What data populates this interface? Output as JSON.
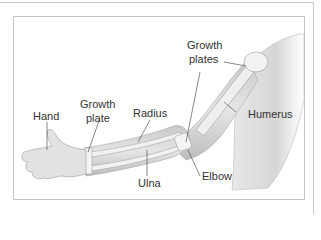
{
  "diagram": {
    "labels": {
      "growth_plates_top_1": "Growth",
      "growth_plates_top_2": "plates",
      "hand": "Hand",
      "growth_plate_1": "Growth",
      "growth_plate_2": "plate",
      "radius": "Radius",
      "humerus": "Humerus",
      "elbow": "Elbow",
      "ulna": "Ulna"
    },
    "colors": {
      "frame_border": "#c4c4c4",
      "label_text": "#333333",
      "leader_line": "#555555",
      "skin_shade": "#d8d8d8",
      "bone": "#eeeeee"
    }
  }
}
